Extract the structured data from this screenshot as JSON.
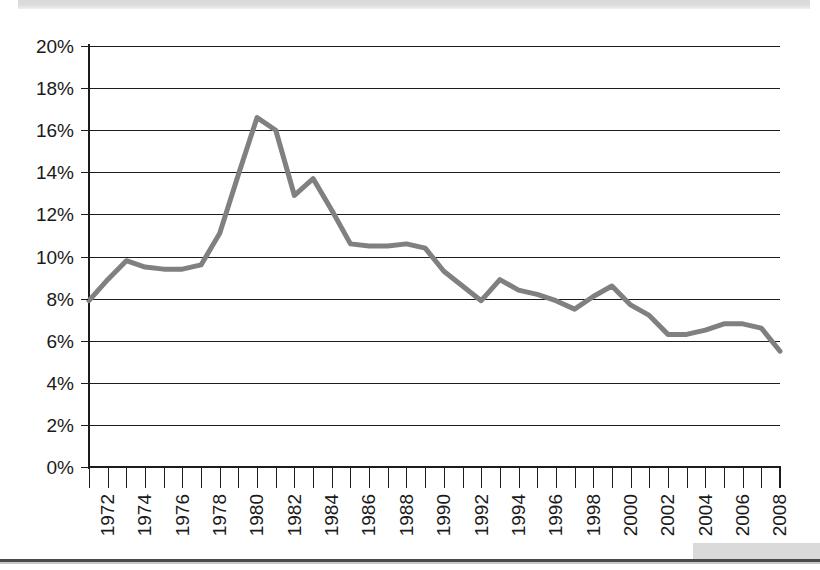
{
  "page": {
    "top_band_text": "",
    "background_color": "#ffffff"
  },
  "chart_data": {
    "type": "line",
    "title": "",
    "subtitle": "",
    "xlabel": "",
    "ylabel": "",
    "grid": true,
    "legend": "none",
    "line_color": "#808080",
    "axis_color": "#1c1c1c",
    "xlim": [
      1972,
      2009
    ],
    "ylim": [
      0,
      20
    ],
    "y_tick_labels": [
      "20%",
      "18%",
      "16%",
      "14%",
      "12%",
      "10%",
      "8%",
      "6%",
      "4%",
      "2%",
      "0%"
    ],
    "y_tick_values": [
      20,
      18,
      16,
      14,
      12,
      10,
      8,
      6,
      4,
      2,
      0
    ],
    "x_tick_labels": [
      "1972",
      "1974",
      "1976",
      "1978",
      "1980",
      "1982",
      "1984",
      "1986",
      "1988",
      "1990",
      "1992",
      "1994",
      "1996",
      "1998",
      "2000",
      "2002",
      "2004",
      "2006",
      "2008"
    ],
    "x_tick_values": [
      1972,
      1974,
      1976,
      1978,
      1980,
      1982,
      1984,
      1986,
      1988,
      1990,
      1992,
      1994,
      1996,
      1998,
      2000,
      2002,
      2004,
      2006,
      2008
    ],
    "x": [
      1972,
      1973,
      1974,
      1975,
      1976,
      1977,
      1978,
      1979,
      1980,
      1981,
      1982,
      1983,
      1984,
      1985,
      1986,
      1987,
      1988,
      1989,
      1990,
      1991,
      1992,
      1993,
      1994,
      1995,
      1996,
      1997,
      1998,
      1999,
      2000,
      2001,
      2002,
      2003,
      2004,
      2005,
      2006,
      2007,
      2008,
      2009
    ],
    "values": [
      7.9,
      8.9,
      9.8,
      9.5,
      9.4,
      9.4,
      9.6,
      11.1,
      13.9,
      16.6,
      16.0,
      12.9,
      13.7,
      12.2,
      10.6,
      10.5,
      10.5,
      10.6,
      10.4,
      9.3,
      8.6,
      7.9,
      8.9,
      8.4,
      8.2,
      7.9,
      7.5,
      8.1,
      8.6,
      7.7,
      7.2,
      6.3,
      6.3,
      6.5,
      6.8,
      6.8,
      6.6,
      5.5
    ],
    "peak": {
      "year": 1981,
      "value": 16.6
    },
    "start": {
      "year": 1972,
      "value": 7.9
    },
    "end": {
      "year": 2009,
      "value": 5.5
    }
  }
}
